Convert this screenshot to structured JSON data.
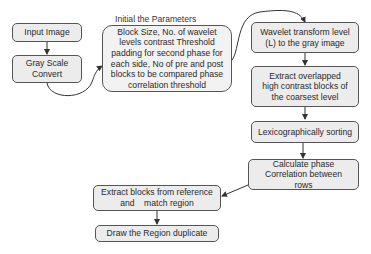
{
  "diagram": {
    "title_label": "Initial the Parameters",
    "nodes": {
      "input_image": "Input Image",
      "gray_scale": "Gray Scale Convert",
      "parameters": "Block Size, No. of wavelet levels contrast Threshold padding for second phase for each side, No of pre and post blocks to be compared phase correlation threshold",
      "wavelet": "Wavelet transform level (L) to the gray image",
      "extract_overlapped": "Extract overlapped high contrast blocks of the coarsest level",
      "lexico": "Lexicographically sorting",
      "phase_corr": "Calculate phase Correlation between rows",
      "extract_blocks": "Extract blocks from reference and    match region",
      "draw_region": "Draw the Region duplicate"
    },
    "edges": [
      {
        "from": "input_image",
        "to": "gray_scale"
      },
      {
        "from": "gray_scale",
        "to": "parameters"
      },
      {
        "from": "parameters",
        "to": "wavelet"
      },
      {
        "from": "wavelet",
        "to": "extract_overlapped"
      },
      {
        "from": "extract_overlapped",
        "to": "lexico"
      },
      {
        "from": "lexico",
        "to": "phase_corr"
      },
      {
        "from": "phase_corr",
        "to": "extract_blocks"
      },
      {
        "from": "extract_blocks",
        "to": "draw_region"
      }
    ],
    "colors": {
      "box_fill": "#ececec",
      "border": "#555555",
      "line": "#333333"
    }
  }
}
